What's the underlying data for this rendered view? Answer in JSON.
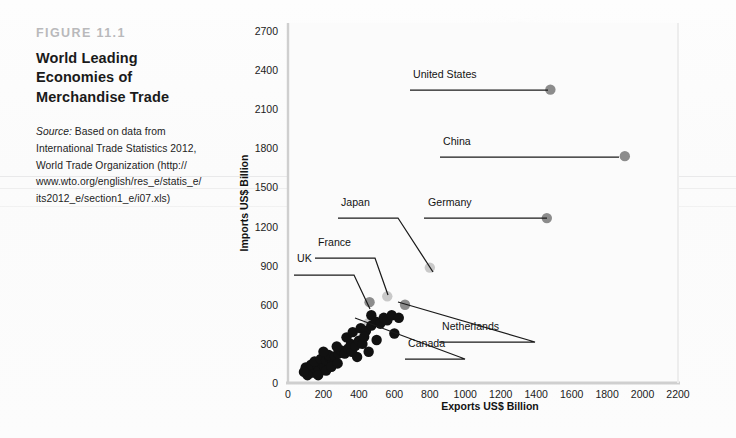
{
  "caption": {
    "figure_number": "FIGURE 11.1",
    "title_lines": [
      "World Leading",
      "Economies of",
      "Merchandise Trade"
    ],
    "source_label": "Source:",
    "source_lines": [
      "Based on data from",
      "International Trade Statistics 2012,",
      "World Trade Organization (http://",
      "www.wto.org/english/res_e/statis_e/",
      "its2012_e/section1_e/i07.xls)"
    ]
  },
  "colors": {
    "highlight_dot": "#8c8c8c",
    "highlight_dot_light": "#c9c9c9",
    "cluster_dot": "#111111",
    "axis": "#cfcfcf",
    "leader_line": "#1a1a1a",
    "tick_text": "#1b1b1b"
  },
  "chart_data": {
    "type": "scatter",
    "title": "World Leading Economies of Merchandise Trade",
    "xlabel": "Exports US$ Billion",
    "ylabel": "Imports US$ Billion",
    "xlim": [
      0,
      2200
    ],
    "ylim": [
      0,
      2700
    ],
    "xticks": [
      0,
      200,
      400,
      600,
      800,
      1000,
      1200,
      1400,
      1600,
      1800,
      2000,
      2200
    ],
    "yticks": [
      0,
      300,
      600,
      900,
      1200,
      1500,
      1800,
      2100,
      2400,
      2700
    ],
    "grid": false,
    "legend": "none",
    "annotations": [
      {
        "label": "United States",
        "x": 1480,
        "y": 2250,
        "dot": "dark",
        "label_px": [
          413,
          78
        ],
        "underline_px": [
          410,
          512,
          90
        ],
        "leader_to_px": [
          548,
          90
        ]
      },
      {
        "label": "China",
        "x": 1900,
        "y": 1740,
        "dot": "dark",
        "label_px": [
          443,
          145
        ],
        "underline_px": [
          440,
          580,
          157
        ],
        "leader_to_px": [
          619,
          157
        ]
      },
      {
        "label": "Germany",
        "x": 1460,
        "y": 1265,
        "dot": "dark",
        "label_px": [
          428,
          206
        ],
        "underline_px": [
          424,
          518,
          218
        ],
        "leader_to_px": [
          547,
          218
        ]
      },
      {
        "label": "Japan",
        "x": 800,
        "y": 885,
        "dot": "light",
        "label_px": [
          341,
          206
        ],
        "underline_px": [
          338,
          398,
          218
        ],
        "leader_to_px": [
          433,
          272
        ]
      },
      {
        "label": "France",
        "x": 560,
        "y": 665,
        "dot": "light",
        "label_px": [
          318,
          246
        ],
        "underline_px": [
          315,
          375,
          258
        ],
        "leader_to_px": [
          388,
          295
        ]
      },
      {
        "label": "UK",
        "x": 460,
        "y": 620,
        "dot": "mid",
        "label_px": [
          297,
          262
        ],
        "underline_px": [
          294,
          354,
          275
        ],
        "leader_to_px": [
          370,
          309
        ]
      },
      {
        "label": "Netherlands",
        "x": 660,
        "y": 600,
        "dot": "mid",
        "label_px": [
          442,
          330
        ],
        "underline_px": [
          439,
          535,
          342
        ],
        "leader_to_px": [
          398,
          302
        ]
      },
      {
        "label": "Canada",
        "x": 455,
        "y": 460,
        "dot": "mid",
        "label_px": [
          408,
          347
        ],
        "underline_px": [
          405,
          465,
          359
        ],
        "leader_to_px": [
          355,
          318
        ]
      }
    ],
    "points": [
      {
        "x": 1480,
        "y": 2250,
        "kind": "highlight"
      },
      {
        "x": 1900,
        "y": 1740,
        "kind": "highlight"
      },
      {
        "x": 1460,
        "y": 1265,
        "kind": "highlight"
      },
      {
        "x": 800,
        "y": 885,
        "kind": "highlight-light"
      },
      {
        "x": 560,
        "y": 665,
        "kind": "highlight-light"
      },
      {
        "x": 460,
        "y": 620,
        "kind": "highlight"
      },
      {
        "x": 660,
        "y": 600,
        "kind": "highlight"
      },
      {
        "x": 455,
        "y": 460,
        "kind": "highlight-light"
      },
      {
        "x": 120,
        "y": 95,
        "kind": "cluster"
      },
      {
        "x": 140,
        "y": 80,
        "kind": "cluster"
      },
      {
        "x": 155,
        "y": 110,
        "kind": "cluster"
      },
      {
        "x": 100,
        "y": 120,
        "kind": "cluster"
      },
      {
        "x": 130,
        "y": 140,
        "kind": "cluster"
      },
      {
        "x": 165,
        "y": 135,
        "kind": "cluster"
      },
      {
        "x": 175,
        "y": 105,
        "kind": "cluster"
      },
      {
        "x": 190,
        "y": 150,
        "kind": "cluster"
      },
      {
        "x": 205,
        "y": 125,
        "kind": "cluster"
      },
      {
        "x": 150,
        "y": 165,
        "kind": "cluster"
      },
      {
        "x": 185,
        "y": 185,
        "kind": "cluster"
      },
      {
        "x": 215,
        "y": 175,
        "kind": "cluster"
      },
      {
        "x": 235,
        "y": 195,
        "kind": "cluster"
      },
      {
        "x": 250,
        "y": 165,
        "kind": "cluster"
      },
      {
        "x": 230,
        "y": 215,
        "kind": "cluster"
      },
      {
        "x": 265,
        "y": 205,
        "kind": "cluster"
      },
      {
        "x": 285,
        "y": 225,
        "kind": "cluster"
      },
      {
        "x": 200,
        "y": 240,
        "kind": "cluster"
      },
      {
        "x": 300,
        "y": 250,
        "kind": "cluster"
      },
      {
        "x": 320,
        "y": 225,
        "kind": "cluster"
      },
      {
        "x": 340,
        "y": 265,
        "kind": "cluster"
      },
      {
        "x": 360,
        "y": 240,
        "kind": "cluster"
      },
      {
        "x": 275,
        "y": 280,
        "kind": "cluster"
      },
      {
        "x": 355,
        "y": 300,
        "kind": "cluster"
      },
      {
        "x": 380,
        "y": 285,
        "kind": "cluster"
      },
      {
        "x": 400,
        "y": 325,
        "kind": "cluster"
      },
      {
        "x": 420,
        "y": 300,
        "kind": "cluster"
      },
      {
        "x": 330,
        "y": 350,
        "kind": "cluster"
      },
      {
        "x": 365,
        "y": 390,
        "kind": "cluster"
      },
      {
        "x": 410,
        "y": 420,
        "kind": "cluster"
      },
      {
        "x": 440,
        "y": 400,
        "kind": "cluster"
      },
      {
        "x": 470,
        "y": 440,
        "kind": "cluster"
      },
      {
        "x": 495,
        "y": 470,
        "kind": "cluster"
      },
      {
        "x": 520,
        "y": 455,
        "kind": "cluster"
      },
      {
        "x": 540,
        "y": 500,
        "kind": "cluster"
      },
      {
        "x": 560,
        "y": 480,
        "kind": "cluster"
      },
      {
        "x": 585,
        "y": 520,
        "kind": "cluster"
      },
      {
        "x": 455,
        "y": 240,
        "kind": "cluster"
      },
      {
        "x": 600,
        "y": 380,
        "kind": "cluster"
      },
      {
        "x": 500,
        "y": 330,
        "kind": "cluster"
      },
      {
        "x": 110,
        "y": 60,
        "kind": "cluster"
      },
      {
        "x": 90,
        "y": 85,
        "kind": "cluster"
      },
      {
        "x": 170,
        "y": 60,
        "kind": "cluster"
      },
      {
        "x": 215,
        "y": 95,
        "kind": "cluster"
      },
      {
        "x": 245,
        "y": 125,
        "kind": "cluster"
      },
      {
        "x": 280,
        "y": 150,
        "kind": "cluster"
      },
      {
        "x": 430,
        "y": 355,
        "kind": "cluster"
      },
      {
        "x": 625,
        "y": 500,
        "kind": "cluster"
      },
      {
        "x": 470,
        "y": 520,
        "kind": "cluster"
      },
      {
        "x": 390,
        "y": 200,
        "kind": "cluster"
      }
    ]
  }
}
